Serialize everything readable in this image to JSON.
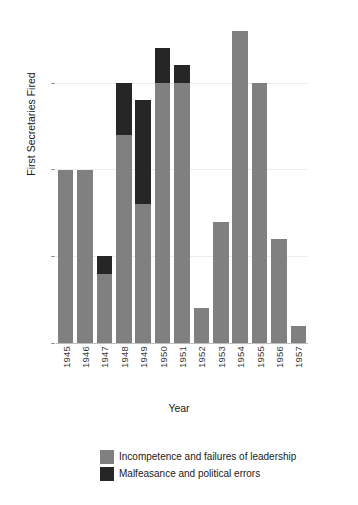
{
  "chart_data": {
    "type": "bar",
    "subtype": "stacked",
    "title": "",
    "xlabel": "Year",
    "ylabel": "First Secretaries Fired",
    "categories": [
      "1945",
      "1946",
      "1947",
      "1948",
      "1949",
      "1950",
      "1951",
      "1952",
      "1953",
      "1954",
      "1955",
      "1956",
      "1957"
    ],
    "series": [
      {
        "name": "Incompetence and failures of leadership",
        "color": "#808080",
        "values": [
          10,
          10,
          4,
          12,
          8,
          15,
          15,
          2,
          7,
          18,
          15,
          6,
          1
        ]
      },
      {
        "name": "Malfeasance and political errors",
        "color": "#262626",
        "values": [
          0,
          0,
          1,
          3,
          6,
          2,
          1,
          0,
          0,
          0,
          0,
          0,
          0
        ]
      }
    ],
    "totals": [
      10,
      10,
      5,
      15,
      14,
      17,
      16,
      2,
      7,
      18,
      15,
      6,
      1
    ],
    "ylim": [
      0,
      18.5
    ],
    "yticks": [
      0,
      5,
      10,
      15
    ],
    "ytick_labels": [
      "0",
      "5",
      "10",
      "15"
    ],
    "grid": "horizontal",
    "legend_position": "bottom"
  },
  "axes": {
    "y_title": "First Secretaries Fired",
    "x_title": "Year"
  },
  "legend": {
    "entries": [
      {
        "label": "Incompetence and failures of leadership",
        "color": "#808080"
      },
      {
        "label": "Malfeasance and political errors",
        "color": "#262626"
      }
    ]
  },
  "colors": {
    "background": "#ffffff",
    "gridline": "#ececec",
    "axis_line": "#bdbdbd",
    "text": "#1a1a1a",
    "tick_text": "#3a3a3a"
  }
}
